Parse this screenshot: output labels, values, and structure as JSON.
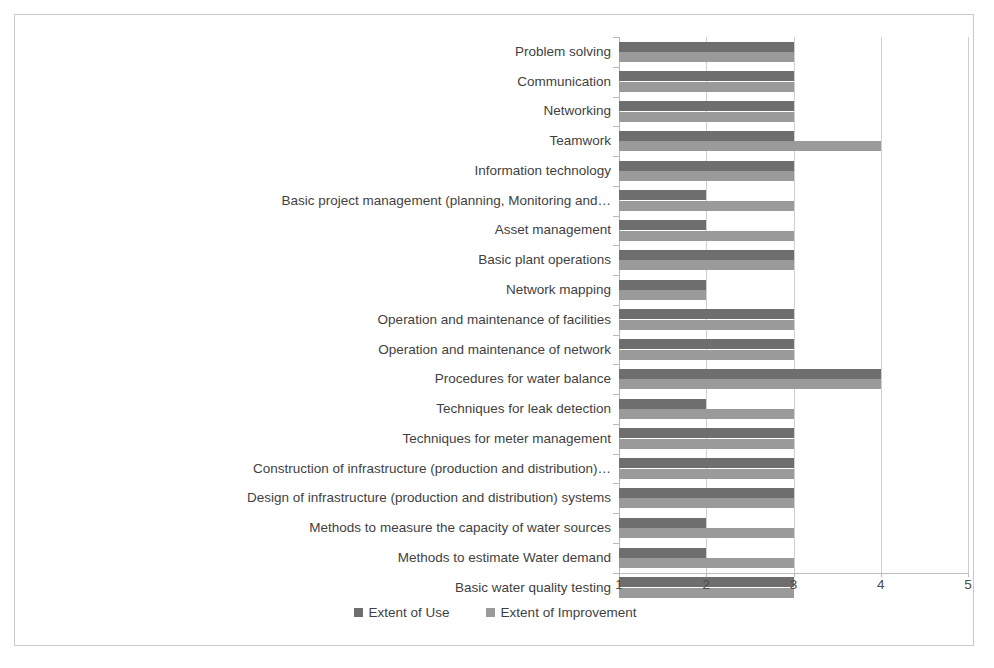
{
  "chart_data": {
    "type": "bar",
    "orientation": "horizontal",
    "title": "",
    "subtitle": "",
    "xlabel": "",
    "ylabel": "",
    "xlim": [
      1,
      5
    ],
    "xticks": [
      "1",
      "2",
      "3",
      "4",
      "5"
    ],
    "grid": true,
    "legend_position": "bottom",
    "categories": [
      "Problem solving",
      "Communication",
      "Networking",
      "Teamwork",
      "Information technology",
      "Basic project management (planning, Monitoring and…",
      "Asset management",
      "Basic plant operations",
      "Network mapping",
      "Operation and maintenance of facilities",
      "Operation and maintenance of network",
      "Procedures for water balance",
      "Techniques  for leak detection",
      "Techniques for meter management",
      "Construction of infrastructure (production and distribution)…",
      "Design of infrastructure (production and distribution) systems",
      "Methods to measure the capacity of water sources",
      "Methods to estimate Water demand",
      "Basic water quality testing"
    ],
    "series": [
      {
        "name": "Extent of Use",
        "color": "#6e6e6e",
        "values": [
          3,
          3,
          3,
          3,
          3,
          2,
          2,
          3,
          2,
          3,
          3,
          4,
          2,
          3,
          3,
          3,
          2,
          2,
          3
        ]
      },
      {
        "name": "Extent of Improvement",
        "color": "#9a9a9a",
        "values": [
          3,
          3,
          3,
          4,
          3,
          3,
          3,
          3,
          2,
          3,
          3,
          4,
          3,
          3,
          3,
          3,
          3,
          3,
          3
        ]
      }
    ]
  },
  "legend": {
    "items": [
      {
        "label": "Extent of Use",
        "color": "#6e6e6e"
      },
      {
        "label": "Extent of Improvement",
        "color": "#9a9a9a"
      }
    ]
  },
  "colors": {
    "series_use": "#6e6e6e",
    "series_improvement": "#9a9a9a",
    "gridline": "#d0d0d0",
    "axis": "#bdbdbd",
    "frame_border": "#c9c9c9",
    "text": "#3f3f3f",
    "background": "#ffffff"
  }
}
